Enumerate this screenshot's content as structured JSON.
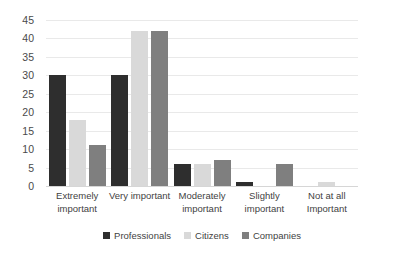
{
  "chart_data": {
    "type": "bar",
    "title": "",
    "subtitle": "",
    "xlabel": "",
    "ylabel": "",
    "ylim": [
      0,
      45
    ],
    "ytick_step": 5,
    "yticks": [
      45,
      40,
      35,
      30,
      25,
      20,
      15,
      10,
      5,
      0
    ],
    "grid": true,
    "grid_axis": "y",
    "legend_position": "bottom",
    "categories": [
      "Extremely important",
      "Very important",
      "Moderately important",
      "Slightly important",
      "Not at all Important"
    ],
    "category_lines": [
      [
        "Extremely",
        "important"
      ],
      [
        "Very important",
        ""
      ],
      [
        "Moderately",
        "important"
      ],
      [
        "Slightly",
        "important"
      ],
      [
        "Not at all",
        "Important"
      ]
    ],
    "series": [
      {
        "name": "Professionals",
        "color": "#2e2e2e",
        "values": [
          30,
          30,
          6,
          1,
          0
        ]
      },
      {
        "name": "Citizens",
        "color": "#d9d9d9",
        "values": [
          18,
          42,
          6,
          0,
          1
        ]
      },
      {
        "name": "Companies",
        "color": "#7f7f7f",
        "values": [
          11,
          42,
          7,
          6,
          0
        ]
      }
    ]
  },
  "colors": {
    "background": "#ffffff",
    "gridline": "#e9e9e9",
    "baseline": "#d6d6d6",
    "text": "#3f3f3f",
    "professionals": "#2e2e2e",
    "citizens": "#d9d9d9",
    "companies": "#7f7f7f"
  }
}
